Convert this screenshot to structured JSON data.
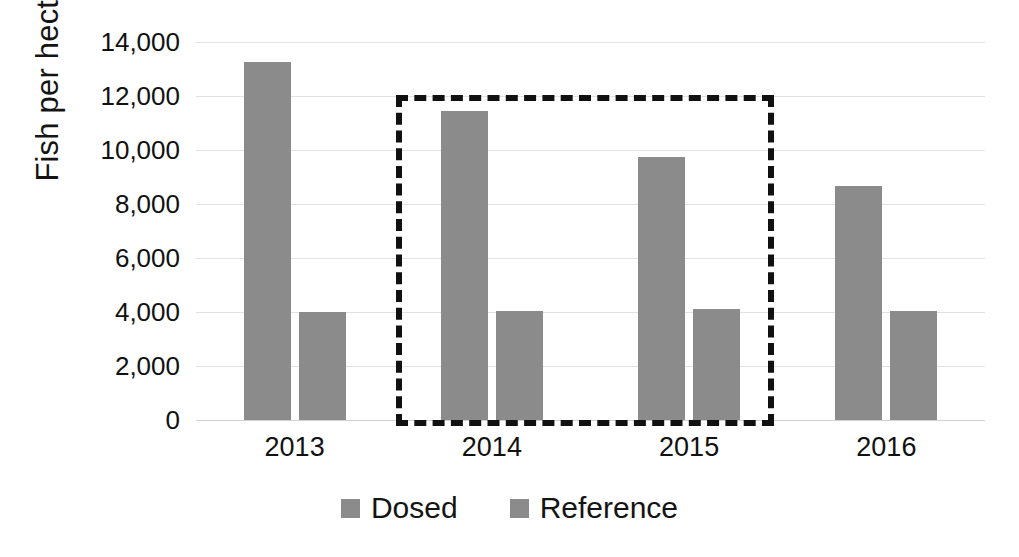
{
  "chart_data": {
    "type": "bar",
    "title": "",
    "xlabel": "",
    "ylabel": "Fish per hectare",
    "categories": [
      "2013",
      "2014",
      "2015",
      "2016"
    ],
    "series": [
      {
        "name": "Dosed",
        "color": "#8b8b8b",
        "values": [
          13250,
          11450,
          9750,
          8650
        ]
      },
      {
        "name": "Reference",
        "color": "#8b8b8b",
        "values": [
          4000,
          4050,
          4120,
          4050
        ]
      }
    ],
    "ylim": [
      0,
      14000
    ],
    "ytick_values": [
      0,
      2000,
      4000,
      6000,
      8000,
      10000,
      12000,
      14000
    ],
    "ytick_labels": [
      "0",
      "2,000",
      "4,000",
      "6,000",
      "8,000",
      "10,000",
      "12,000",
      "14,000"
    ],
    "grid": true,
    "legend_position": "bottom",
    "annotations": [
      {
        "type": "dashed-rectangle",
        "name": "highlight-box",
        "covers_categories": [
          "2014",
          "2015"
        ],
        "color": "#111111",
        "style": "dashed"
      }
    ]
  },
  "legend": {
    "entries": [
      {
        "label": "Dosed",
        "swatch_color": "#8b8b8b"
      },
      {
        "label": "Reference",
        "swatch_color": "#8b8b8b"
      }
    ]
  },
  "axis": {
    "y_title": "Fish per hectare"
  }
}
